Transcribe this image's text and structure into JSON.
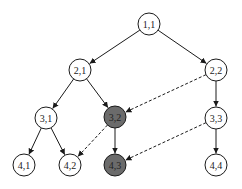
{
  "diagram": {
    "type": "tree-graph",
    "colors": {
      "node_default_fill": "#ffffff",
      "node_highlight_fill": "#6b6b6b",
      "stroke": "#1a1a1a"
    },
    "node_radius": 11,
    "nodes": [
      {
        "id": "1,1",
        "label": "1,1",
        "x": 149,
        "y": 24,
        "highlighted": false
      },
      {
        "id": "2,1",
        "label": "2,1",
        "x": 80,
        "y": 70,
        "highlighted": false
      },
      {
        "id": "2,2",
        "label": "2,2",
        "x": 216,
        "y": 70,
        "highlighted": false
      },
      {
        "id": "3,1",
        "label": "3,1",
        "x": 46,
        "y": 118,
        "highlighted": false
      },
      {
        "id": "3,2",
        "label": "3,2",
        "x": 115,
        "y": 117,
        "highlighted": true
      },
      {
        "id": "3,3",
        "label": "3,3",
        "x": 216,
        "y": 118,
        "highlighted": false
      },
      {
        "id": "4,1",
        "label": "4,1",
        "x": 24,
        "y": 165,
        "highlighted": false
      },
      {
        "id": "4,2",
        "label": "4,2",
        "x": 70,
        "y": 165,
        "highlighted": false
      },
      {
        "id": "4,3",
        "label": "4,3",
        "x": 115,
        "y": 165,
        "highlighted": true
      },
      {
        "id": "4,4",
        "label": "4,4",
        "x": 216,
        "y": 165,
        "highlighted": false
      }
    ],
    "edges": [
      {
        "from": "1,1",
        "to": "2,1",
        "style": "solid"
      },
      {
        "from": "1,1",
        "to": "2,2",
        "style": "solid"
      },
      {
        "from": "2,1",
        "to": "3,1",
        "style": "solid"
      },
      {
        "from": "2,1",
        "to": "3,2",
        "style": "solid"
      },
      {
        "from": "2,2",
        "to": "3,2",
        "style": "dashed"
      },
      {
        "from": "2,2",
        "to": "3,3",
        "style": "solid"
      },
      {
        "from": "3,1",
        "to": "4,1",
        "style": "solid"
      },
      {
        "from": "3,1",
        "to": "4,2",
        "style": "solid"
      },
      {
        "from": "3,2",
        "to": "4,2",
        "style": "dashed"
      },
      {
        "from": "3,2",
        "to": "4,3",
        "style": "solid"
      },
      {
        "from": "3,3",
        "to": "4,3",
        "style": "dashed"
      },
      {
        "from": "3,3",
        "to": "4,4",
        "style": "solid"
      }
    ]
  }
}
